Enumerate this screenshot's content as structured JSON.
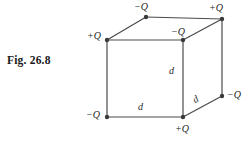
{
  "figure": {
    "caption": "Fig. 26.8",
    "background_color": "#ffffff",
    "line_color": "#4a4a4a",
    "vertex_color": "#3a3a3a",
    "text_color": "#242424"
  },
  "diagram_data": {
    "type": "diagram",
    "shape": "cube",
    "edge_length_symbol": "d",
    "vertices": [
      {
        "id": "back-top-left",
        "label": "−Q",
        "x": 146,
        "y": 17
      },
      {
        "id": "back-top-right",
        "label": "+Q",
        "x": 222,
        "y": 19
      },
      {
        "id": "front-top-left",
        "label": "+Q",
        "x": 107,
        "y": 40
      },
      {
        "id": "front-top-right",
        "label": "−Q",
        "x": 183,
        "y": 40
      },
      {
        "id": "back-bottom-right",
        "label": "−Q",
        "x": 222,
        "y": 96
      },
      {
        "id": "front-bottom-left",
        "label": "−Q",
        "x": 107,
        "y": 117
      },
      {
        "id": "front-bottom-right",
        "label": "+Q",
        "x": 183,
        "y": 117
      }
    ],
    "dimension_labels": [
      {
        "id": "d-vertical",
        "label": "d",
        "x": 169,
        "y": 66
      },
      {
        "id": "d-bottom",
        "label": "d",
        "x": 138,
        "y": 102
      },
      {
        "id": "d-diagonal",
        "label": "d",
        "x": 196,
        "y": 88
      }
    ],
    "vertex_label_positions": [
      {
        "id": "label-back-top-left",
        "text": "−Q",
        "x": 134,
        "y": 2
      },
      {
        "id": "label-back-top-right",
        "text": "+Q",
        "x": 209,
        "y": 3
      },
      {
        "id": "label-front-top-left",
        "text": "+Q",
        "x": 87,
        "y": 31
      },
      {
        "id": "label-front-top-right",
        "text": "−Q",
        "x": 171,
        "y": 27
      },
      {
        "id": "label-back-bottom-right",
        "text": "−Q",
        "x": 227,
        "y": 90
      },
      {
        "id": "label-front-bottom-left",
        "text": "−Q",
        "x": 86,
        "y": 110
      },
      {
        "id": "label-front-bottom-right",
        "text": "+Q",
        "x": 175,
        "y": 124
      }
    ]
  }
}
